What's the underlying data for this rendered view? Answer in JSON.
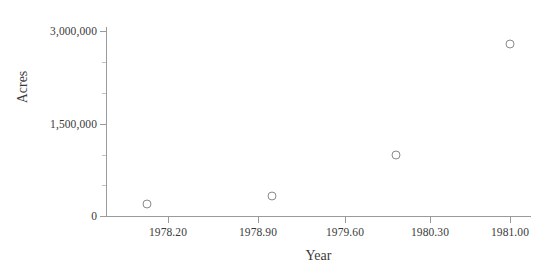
{
  "chart_data": {
    "type": "scatter",
    "title": "",
    "xlabel": "Year",
    "ylabel": "Acres",
    "xlim": [
      1977.95,
      1981.2
    ],
    "ylim": [
      0,
      3100000
    ],
    "grid": false,
    "legend": null,
    "marker_style": "open-circle",
    "x_ticks": [
      {
        "value": 1978.2,
        "label": "1978.20",
        "px": 168
      },
      {
        "value": 1978.9,
        "label": "1978.90",
        "px": 258
      },
      {
        "value": 1979.6,
        "label": "1979.60",
        "px": 345
      },
      {
        "value": 1980.3,
        "label": "1980.30",
        "px": 430
      },
      {
        "value": 1981.0,
        "label": "1981.00",
        "px": 510
      }
    ],
    "y_ticks": [
      {
        "value": 0,
        "label": "0",
        "px": 216
      },
      {
        "value": 1500000,
        "label": "1,500,000",
        "px": 124
      },
      {
        "value": 3000000,
        "label": "3,000,000",
        "px": 31
      }
    ],
    "y_minor_ticks": [
      {
        "value": 500000,
        "px": 185
      },
      {
        "value": 1000000,
        "px": 155
      },
      {
        "value": 2000000,
        "px": 93
      },
      {
        "value": 2500000,
        "px": 62
      }
    ],
    "points": [
      {
        "x": 1978.08,
        "y": 195000,
        "px": 147,
        "py": 204
      },
      {
        "x": 1979.01,
        "y": 324000,
        "px": 272,
        "py": 196
      },
      {
        "x": 1980.02,
        "y": 989000,
        "px": 396,
        "py": 155
      },
      {
        "x": 1981.0,
        "y": 2790000,
        "px": 510,
        "py": 44
      }
    ],
    "colors": {
      "marker_stroke": "#8a8a8a",
      "axis": "#9a9a9a",
      "text": "#3a3a3a",
      "background": "#ffffff"
    }
  }
}
